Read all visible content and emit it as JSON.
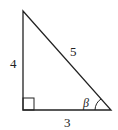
{
  "diagram": {
    "type": "right-triangle",
    "labels": {
      "vertical_side": "4",
      "hypotenuse": "5",
      "horizontal_side": "3",
      "angle": "β"
    },
    "colors": {
      "stroke": "#222222",
      "background": "#ffffff"
    }
  }
}
